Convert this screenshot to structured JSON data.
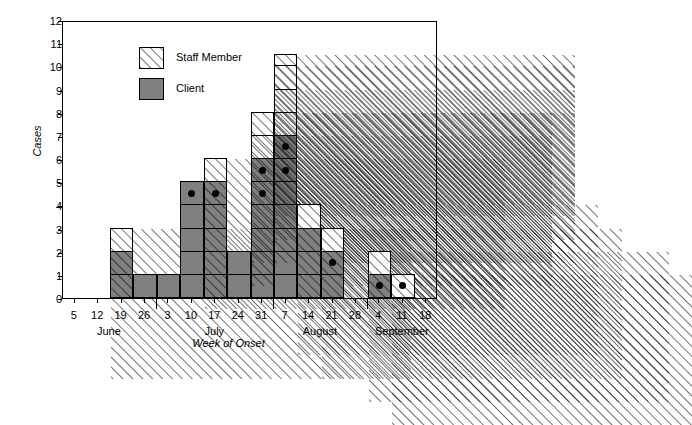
{
  "chart_data": {
    "type": "bar",
    "title": "",
    "xlabel": "Week of Onset",
    "ylabel": "Cases",
    "ylim": [
      0,
      12
    ],
    "ytick_step": 1,
    "yticks": [
      0,
      1,
      2,
      3,
      4,
      5,
      6,
      7,
      8,
      9,
      10,
      11,
      12
    ],
    "grid": false,
    "stacked": true,
    "legend_position": "top-left",
    "legend": [
      "Staff Member",
      "Client"
    ],
    "series": [
      {
        "name": "Client",
        "color": "#808080",
        "values": [
          0,
          0,
          2,
          1,
          1,
          5,
          5,
          2,
          6,
          7,
          3,
          2,
          0,
          1,
          0,
          0
        ]
      },
      {
        "name": "Staff Member",
        "color": "#ffffff",
        "pattern": "diagonal-hatch",
        "values": [
          0,
          0,
          1,
          0,
          0,
          0,
          1,
          0,
          2,
          3.5,
          1,
          1,
          0,
          1,
          1,
          0
        ]
      }
    ],
    "categories": [
      "5",
      "12",
      "19",
      "26",
      "3",
      "10",
      "17",
      "24",
      "31",
      "7",
      "14",
      "21",
      "28",
      "4",
      "11",
      "18"
    ],
    "totals": [
      0,
      0,
      3,
      1,
      1,
      5,
      6,
      2,
      8,
      10.5,
      4,
      3,
      0,
      2,
      1,
      0
    ],
    "marker_note": "filled black dot marks an individual case cell",
    "markers": [
      {
        "category": "10",
        "level": 5
      },
      {
        "category": "17",
        "level": 5
      },
      {
        "category": "31",
        "level": 5
      },
      {
        "category": "31",
        "level": 6
      },
      {
        "category": "7",
        "level": 6
      },
      {
        "category": "7",
        "level": 7
      },
      {
        "category": "21",
        "level": 2
      },
      {
        "category": "4",
        "level": 1
      },
      {
        "category": "11",
        "level": 1
      }
    ],
    "months": [
      {
        "label": "June",
        "ticks": [
          "5",
          "12",
          "19",
          "26"
        ]
      },
      {
        "label": "July",
        "ticks": [
          "3",
          "10",
          "17",
          "24",
          "31"
        ]
      },
      {
        "label": "August",
        "ticks": [
          "7",
          "14",
          "21",
          "28"
        ]
      },
      {
        "label": "September",
        "ticks": [
          "4",
          "11",
          "18"
        ]
      }
    ]
  },
  "axes": {
    "y_title": "Cases",
    "x_title": "Week of Onset",
    "y_tick_labels": [
      "12",
      "11",
      "10",
      "9",
      "8",
      "7",
      "6",
      "5",
      "4",
      "3",
      "2",
      "1",
      "0"
    ],
    "x_tick_labels": [
      "5",
      "12",
      "19",
      "26",
      "3",
      "10",
      "17",
      "24",
      "31",
      "7",
      "14",
      "21",
      "28",
      "4",
      "11",
      "18"
    ],
    "month_labels": [
      "June",
      "July",
      "August",
      "September"
    ]
  },
  "legend": {
    "items": [
      {
        "label": "Staff Member",
        "style": "staff"
      },
      {
        "label": "Client",
        "style": "client"
      }
    ]
  },
  "colors": {
    "client_fill": "#808080",
    "staff_fill": "#ffffff",
    "outline": "#000000",
    "background": "#ffffff"
  }
}
